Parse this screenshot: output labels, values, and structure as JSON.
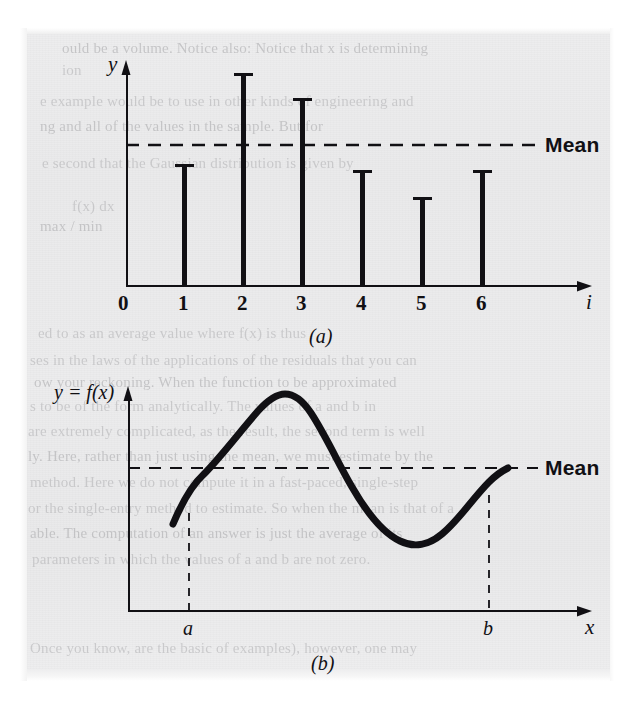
{
  "figure": {
    "background_color": "#eaeaeb",
    "ink_color": "#111014",
    "panels": [
      {
        "caption": "(a)",
        "x_axis_label": "i",
        "y_axis_label": "y",
        "mean_label": "Mean",
        "tick_labels": [
          "0",
          "1",
          "2",
          "3",
          "4",
          "5",
          "6"
        ]
      },
      {
        "caption": "(b)",
        "x_axis_label": "x",
        "y_axis_label": "y = f(x)",
        "mean_label": "Mean",
        "tick_labels": [
          "a",
          "b"
        ]
      }
    ]
  },
  "ghost_text": [
    {
      "text": "ould be a volume. Notice also: Notice that x is determining",
      "x": 62,
      "y": 40
    },
    {
      "text": "ion",
      "x": 62,
      "y": 62
    },
    {
      "text": "e example would be to use in other kinds of engineering and",
      "x": 40,
      "y": 93
    },
    {
      "text": "ng and all of the values in the sample. But for",
      "x": 40,
      "y": 118
    },
    {
      "text": "e second that the Gaussian distribution is given by",
      "x": 42,
      "y": 155
    },
    {
      "text": "f(x) dx",
      "x": 72,
      "y": 198
    },
    {
      "text": "max / min",
      "x": 40,
      "y": 218
    },
    {
      "text": "ed to as an average value where f(x) is thus",
      "x": 38,
      "y": 325
    },
    {
      "text": "ses in the laws of the applications of the residuals that you can",
      "x": 30,
      "y": 352
    },
    {
      "text": "ow your reckoning. When the function to be approximated",
      "x": 34,
      "y": 374
    },
    {
      "text": "s to be of the form analytically. The values of a and b in",
      "x": 30,
      "y": 398
    },
    {
      "text": "are extremely complicated, as the result, the second term is well",
      "x": 28,
      "y": 423
    },
    {
      "text": "ly. Here, rather than just using the mean, we must estimate by the",
      "x": 28,
      "y": 448
    },
    {
      "text": "method. Here we do not compute it in a fast-paced, single-step",
      "x": 30,
      "y": 474
    },
    {
      "text": "or the single-entry method to estimate. So when the mean is that of a",
      "x": 28,
      "y": 500
    },
    {
      "text": "able. The computation of an answer is just the average of its",
      "x": 30,
      "y": 525
    },
    {
      "text": "parameters in which the values of a and b are not zero.",
      "x": 32,
      "y": 551
    },
    {
      "text": "Once you know, are the basic of examples), however, one may",
      "x": 30,
      "y": 640
    }
  ],
  "chart_data": [
    {
      "type": "bar",
      "panel": "(a)",
      "title": "",
      "xlabel": "i",
      "ylabel": "y",
      "categories": [
        "1",
        "2",
        "3",
        "4",
        "5",
        "6"
      ],
      "values": [
        3.35,
        6.2,
        5.45,
        3.2,
        2.6,
        3.2
      ],
      "tick_labels": [
        "0",
        "1",
        "2",
        "3",
        "4",
        "5",
        "6"
      ],
      "xlim": [
        0,
        7.8
      ],
      "ylim": [
        0,
        7.3
      ],
      "mean_value": 4.0,
      "mean_label": "Mean",
      "grid": false,
      "legend": "none",
      "annotations": [
        "Mean"
      ]
    },
    {
      "type": "line",
      "panel": "(b)",
      "title": "",
      "xlabel": "x",
      "ylabel": "y = f(x)",
      "x": [
        0.95,
        1.3,
        1.7,
        2.1,
        2.5,
        2.9,
        3.3,
        3.7,
        4.1,
        4.5,
        4.9,
        5.3,
        5.7,
        6.1,
        6.5,
        6.9,
        7.3,
        7.7,
        8.1,
        8.5,
        8.9,
        9.3
      ],
      "y": [
        1.85,
        2.55,
        3.25,
        3.85,
        4.3,
        4.62,
        4.78,
        4.75,
        4.55,
        4.2,
        3.78,
        3.3,
        2.85,
        2.45,
        2.12,
        1.92,
        1.85,
        1.95,
        2.2,
        2.6,
        3.1,
        3.55
      ],
      "xlim": [
        0,
        10.4
      ],
      "ylim": [
        0,
        5.6
      ],
      "mean_value": 3.55,
      "mean_label": "Mean",
      "tick_labels": [
        "a",
        "b"
      ],
      "tick_positions": [
        1.3,
        8.5
      ],
      "grid": false,
      "legend": "none",
      "annotations": [
        "Mean",
        "a",
        "b"
      ]
    }
  ]
}
